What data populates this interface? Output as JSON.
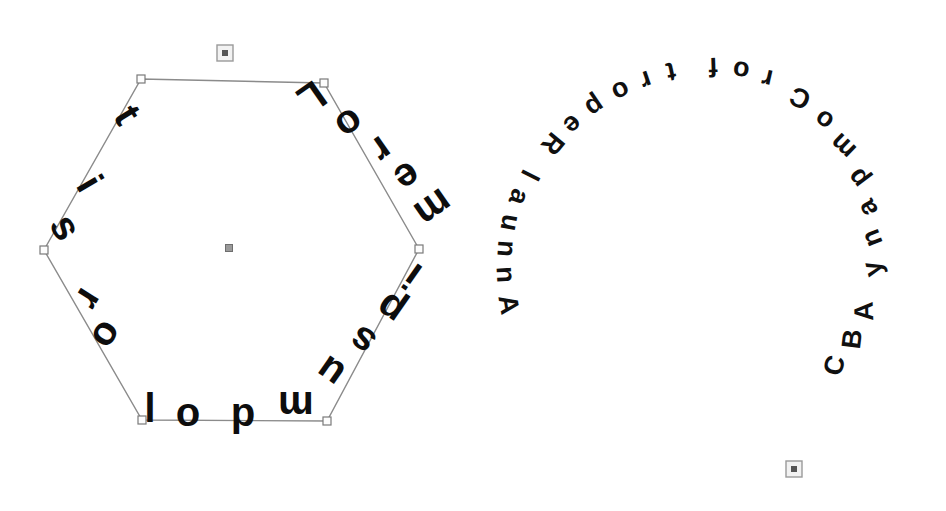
{
  "app": {
    "title": "Text on Path Canvas",
    "background_color": "#ffffff",
    "path_stroke_color": "#8b8b8b",
    "glyph_color": "#0d0d0d",
    "handle_fill_color": "#fdfdfd",
    "handle_stroke_color": "#7a7a7a"
  },
  "objects": [
    {
      "id": "hexagon-text-object",
      "name": "hexagon-text-path",
      "shape": "hexagon",
      "text": "Lorem ipsum dolor sit",
      "font_size": 40,
      "center": {
        "x": 228,
        "y": 248
      },
      "radius": 176,
      "path_visible": true,
      "selected": true,
      "glyphs": [
        {
          "char": "L",
          "x": 304,
          "y": 86,
          "rotate": 145
        },
        {
          "char": "o",
          "x": 342,
          "y": 113,
          "rotate": 145
        },
        {
          "char": "r",
          "x": 374,
          "y": 139,
          "rotate": 145
        },
        {
          "char": "e",
          "x": 400,
          "y": 166,
          "rotate": 145
        },
        {
          "char": "m",
          "x": 426,
          "y": 197,
          "rotate": 145
        },
        {
          "char": "i",
          "x": 420,
          "y": 265,
          "rotate": 215
        },
        {
          "char": "p",
          "x": 398,
          "y": 298,
          "rotate": 215
        },
        {
          "char": "s",
          "x": 370,
          "y": 330,
          "rotate": 215
        },
        {
          "char": "u",
          "x": 338,
          "y": 361,
          "rotate": 215
        },
        {
          "char": "m",
          "x": 296,
          "y": 392,
          "rotate": 180
        },
        {
          "char": "d",
          "x": 243,
          "y": 404,
          "rotate": 180
        },
        {
          "char": "o",
          "x": 188,
          "y": 404,
          "rotate": 180
        },
        {
          "char": "l",
          "x": 150,
          "y": 392,
          "rotate": 180
        },
        {
          "char": "o",
          "x": 96,
          "y": 328,
          "rotate": 122
        },
        {
          "char": "r",
          "x": 78,
          "y": 292,
          "rotate": 122
        },
        {
          "char": "s",
          "x": 54,
          "y": 234,
          "rotate": 60
        },
        {
          "char": "i",
          "x": 78,
          "y": 190,
          "rotate": 60
        },
        {
          "char": "t",
          "x": 116,
          "y": 122,
          "rotate": 58
        }
      ],
      "vertices": [
        {
          "x": 141,
          "y": 79
        },
        {
          "x": 324,
          "y": 83
        },
        {
          "x": 419,
          "y": 249
        },
        {
          "x": 327,
          "y": 421
        },
        {
          "x": 142,
          "y": 420
        },
        {
          "x": 44,
          "y": 250
        }
      ],
      "rotation_handle": {
        "x": 225,
        "y": 53
      },
      "center_handle": {
        "x": 229,
        "y": 248
      }
    },
    {
      "id": "circle-text-object",
      "name": "circle-text-path",
      "shape": "circle",
      "text": "Annual Report for Company ABC",
      "font_size": 27,
      "center": {
        "x": 704,
        "y": 240
      },
      "radius": 200,
      "path_visible": false,
      "selected": true,
      "glyphs": [
        {
          "char": "A",
          "x": 500,
          "y": 306,
          "rotate": -100
        },
        {
          "char": "n",
          "x": 497,
          "y": 275,
          "rotate": -93
        },
        {
          "char": "n",
          "x": 498,
          "y": 248,
          "rotate": -86
        },
        {
          "char": "u",
          "x": 502,
          "y": 221,
          "rotate": -79
        },
        {
          "char": "a",
          "x": 511,
          "y": 194,
          "rotate": -70
        },
        {
          "char": "l",
          "x": 522,
          "y": 171,
          "rotate": -63
        },
        {
          "char": "R",
          "x": 546,
          "y": 138,
          "rotate": -50
        },
        {
          "char": "e",
          "x": 567,
          "y": 118,
          "rotate": -42
        },
        {
          "char": "p",
          "x": 590,
          "y": 99,
          "rotate": -34
        },
        {
          "char": "o",
          "x": 617,
          "y": 83,
          "rotate": -26
        },
        {
          "char": "r",
          "x": 643,
          "y": 72,
          "rotate": -19
        },
        {
          "char": "t",
          "x": 669,
          "y": 63,
          "rotate": -12
        },
        {
          "char": "f",
          "x": 713,
          "y": 58,
          "rotate": -2
        },
        {
          "char": "o",
          "x": 742,
          "y": 62,
          "rotate": 6
        },
        {
          "char": "r",
          "x": 769,
          "y": 70,
          "rotate": 13
        },
        {
          "char": "C",
          "x": 804,
          "y": 90,
          "rotate": 25
        },
        {
          "char": "o",
          "x": 829,
          "y": 113,
          "rotate": 35
        },
        {
          "char": "m",
          "x": 849,
          "y": 140,
          "rotate": 44
        },
        {
          "char": "p",
          "x": 865,
          "y": 173,
          "rotate": 53
        },
        {
          "char": "a",
          "x": 875,
          "y": 204,
          "rotate": 61
        },
        {
          "char": "n",
          "x": 880,
          "y": 235,
          "rotate": 69
        },
        {
          "char": "y",
          "x": 881,
          "y": 267,
          "rotate": 76
        },
        {
          "char": "A",
          "x": 873,
          "y": 311,
          "rotate": 88
        },
        {
          "char": "B",
          "x": 861,
          "y": 340,
          "rotate": 97
        },
        {
          "char": "C",
          "x": 843,
          "y": 368,
          "rotate": 106
        }
      ],
      "rotation_handle": {
        "x": 794,
        "y": 469
      }
    }
  ],
  "handles": {
    "rotation_handle_label": "rotation-handle",
    "vertex_handle_label": "vertex-handle",
    "center_handle_label": "center-handle"
  }
}
